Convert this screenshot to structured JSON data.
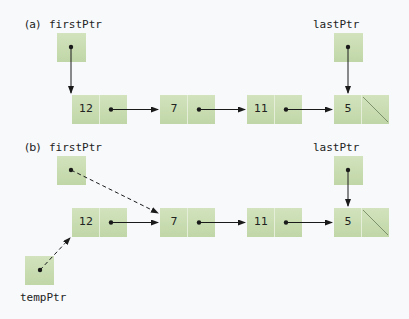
{
  "panel_a": {
    "label": "(a)",
    "first_ptr": "firstPtr",
    "last_ptr": "lastPtr",
    "nodes": [
      "12",
      "7",
      "11",
      "5"
    ]
  },
  "panel_b": {
    "label": "(b)",
    "first_ptr": "firstPtr",
    "last_ptr": "lastPtr",
    "temp_ptr": "tempPtr",
    "nodes": [
      "12",
      "7",
      "11",
      "5"
    ]
  },
  "colors": {
    "box_fill": "#c9ddb2",
    "box_border": "#a9c48f",
    "box_divider": "#e4eed8",
    "line": "#1a1a1a"
  }
}
